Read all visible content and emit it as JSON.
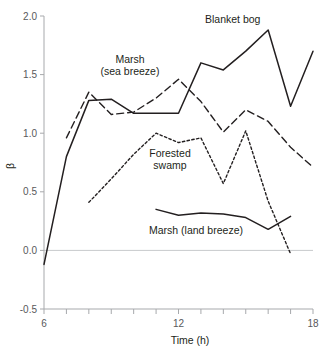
{
  "chart_data": {
    "type": "line",
    "title": "",
    "xlabel": "Time (h)",
    "ylabel": "β",
    "xlim": [
      6,
      18
    ],
    "ylim": [
      -0.5,
      2.0
    ],
    "xticks": [
      6,
      7,
      8,
      9,
      10,
      11,
      12,
      13,
      14,
      15,
      16,
      17,
      18
    ],
    "xtick_labels": [
      "6",
      "",
      "",
      "",
      "",
      "",
      "12",
      "",
      "",
      "",
      "",
      "",
      "18"
    ],
    "yticks": [
      -0.5,
      0.0,
      0.5,
      1.0,
      1.5,
      2.0
    ],
    "ytick_labels": [
      "-0.5",
      "0.0",
      "0.5",
      "1.0",
      "1.5",
      "2.0"
    ],
    "grid": false,
    "zero_reference_line": true,
    "legend_position": "inline-annotations",
    "series": [
      {
        "name": "Blanket bog",
        "style": "solid",
        "color": "#231f20",
        "x": [
          6,
          7,
          8,
          9,
          10,
          11,
          12,
          13,
          14,
          15,
          16,
          17,
          18
        ],
        "values": [
          -0.12,
          0.8,
          1.28,
          1.29,
          1.17,
          1.17,
          1.17,
          1.6,
          1.54,
          1.7,
          1.88,
          1.23,
          1.7
        ]
      },
      {
        "name": "Marsh (sea breeze)",
        "style": "dashed",
        "color": "#231f20",
        "x": [
          7,
          8,
          9,
          10,
          11,
          12,
          13,
          14,
          15,
          16,
          17,
          18
        ],
        "values": [
          0.96,
          1.35,
          1.16,
          1.18,
          1.3,
          1.46,
          1.27,
          1.01,
          1.2,
          1.1,
          0.88,
          0.71
        ]
      },
      {
        "name": "Forested swamp",
        "style": "dotted",
        "color": "#231f20",
        "x": [
          8,
          9,
          10,
          11,
          12,
          13,
          14,
          15,
          16,
          17
        ],
        "values": [
          0.41,
          0.61,
          0.82,
          1.0,
          0.92,
          0.96,
          0.57,
          1.02,
          0.42,
          -0.03
        ]
      },
      {
        "name": "Marsh (land breeze)",
        "style": "solid",
        "color": "#231f20",
        "x": [
          11,
          12,
          13,
          14,
          15,
          16,
          17
        ],
        "values": [
          0.35,
          0.3,
          0.32,
          0.31,
          0.28,
          0.18,
          0.29
        ]
      }
    ],
    "annotations": [
      {
        "text": "Blanket bog",
        "x_px": 205,
        "y_px": 23,
        "align": "start"
      },
      {
        "text": "Marsh",
        "x_px": 130,
        "y_px": 63,
        "align": "middle"
      },
      {
        "text": "(sea breeze)",
        "x_px": 130,
        "y_px": 75,
        "align": "middle"
      },
      {
        "text": "Forested",
        "x_px": 170,
        "y_px": 157,
        "align": "middle"
      },
      {
        "text": "swamp",
        "x_px": 170,
        "y_px": 169,
        "align": "middle"
      },
      {
        "text": "Marsh (land breeze)",
        "x_px": 196,
        "y_px": 234,
        "align": "middle"
      }
    ]
  }
}
